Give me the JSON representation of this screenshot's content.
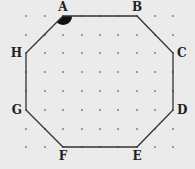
{
  "figure": {
    "type": "dot-grid octagon",
    "background": "#ebebeb",
    "grid": {
      "columns": 9,
      "rows": 8,
      "x": [
        26,
        45,
        63,
        82,
        100,
        118,
        137,
        155,
        173
      ],
      "y": [
        16,
        35,
        53,
        72,
        91,
        110,
        129,
        147
      ],
      "dot_color": "#8a8a8a"
    },
    "line_color": "#333333",
    "vertices": [
      {
        "label": "A",
        "col": 2,
        "row": 0
      },
      {
        "label": "B",
        "col": 6,
        "row": 0
      },
      {
        "label": "C",
        "col": 8,
        "row": 2
      },
      {
        "label": "D",
        "col": 8,
        "row": 5
      },
      {
        "label": "E",
        "col": 6,
        "row": 7
      },
      {
        "label": "F",
        "col": 2,
        "row": 7
      },
      {
        "label": "G",
        "col": 0,
        "row": 5
      },
      {
        "label": "H",
        "col": 0,
        "row": 2
      }
    ],
    "marked_angle": {
      "vertex": "A",
      "fill": "#111111"
    }
  }
}
